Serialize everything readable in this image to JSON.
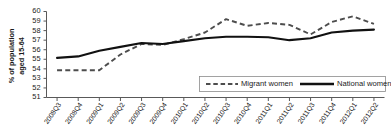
{
  "chart_data": {
    "type": "line",
    "title": "",
    "subtitle": "",
    "xlabel": "",
    "ylabel": "% of population aged 15-64",
    "ylabel_line1": "% of population",
    "ylabel_line2": "aged 15-64",
    "ylim": [
      51,
      60
    ],
    "yticks": [
      51,
      52,
      53,
      54,
      55,
      56,
      57,
      58,
      59,
      60
    ],
    "grid": false,
    "legend_position": "inside-bottom-right",
    "categories": [
      "2008Q3",
      "2008Q4",
      "2009Q1",
      "2009Q2",
      "2009Q3",
      "2009Q4",
      "2010Q1",
      "2010Q2",
      "2010Q3",
      "2010Q4",
      "2011Q1",
      "2011Q2",
      "2011Q3",
      "2011Q4",
      "2012Q1",
      "2012Q2"
    ],
    "series": [
      {
        "name": "Migrant women",
        "style": "dashed",
        "color": "#4d4d4d",
        "values": [
          53.85,
          53.85,
          53.85,
          55.5,
          56.6,
          56.5,
          57.1,
          57.8,
          59.2,
          58.5,
          58.8,
          58.6,
          57.6,
          58.9,
          59.5,
          58.7
        ]
      },
      {
        "name": "National women",
        "style": "solid",
        "color": "#111111",
        "values": [
          55.15,
          55.3,
          55.9,
          56.3,
          56.7,
          56.6,
          56.9,
          57.2,
          57.35,
          57.35,
          57.3,
          57.0,
          57.2,
          57.8,
          58.0,
          58.1
        ]
      }
    ],
    "legend": [
      {
        "label": "Migrant women",
        "style": "dashed"
      },
      {
        "label": "National women",
        "style": "solid"
      }
    ]
  }
}
